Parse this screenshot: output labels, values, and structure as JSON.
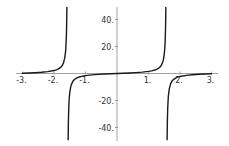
{
  "chart_data": {
    "type": "line",
    "title": "",
    "xlabel": "",
    "ylabel": "",
    "function": "tan(x)",
    "xlim": [
      -3.2,
      3.2
    ],
    "ylim": [
      -49,
      49
    ],
    "grid": false,
    "legend": null,
    "x_ticks": [
      -3,
      -2,
      -1,
      1,
      2,
      3
    ],
    "x_tick_labels": [
      "-3.",
      "-2.",
      "-1.",
      "1.",
      "2.",
      "3."
    ],
    "y_ticks": [
      40,
      20,
      -20,
      -40
    ],
    "y_tick_labels": [
      "40.",
      "20.",
      "-20.",
      "-40."
    ],
    "colors": {
      "curve": "#1a1a1a",
      "axis": "#8a8a8a",
      "background": "#ffffff"
    },
    "series": [
      {
        "name": "tan(x) branch 1",
        "x": [
          -3.0,
          -2.8,
          -2.6,
          -2.4,
          -2.2,
          -2.0,
          -1.9,
          -1.8,
          -1.75,
          -1.7,
          -1.66,
          -1.63,
          -1.61,
          -1.6,
          -1.595,
          -1.5912
        ],
        "y": [
          0.1425,
          0.3555,
          0.6016,
          0.916,
          1.3738,
          2.185,
          2.9271,
          4.2863,
          5.5221,
          7.6966,
          11.3849,
          16.8341,
          25.495,
          34.2325,
          41.5,
          49.0
        ]
      },
      {
        "name": "tan(x) branch 2",
        "x": [
          -1.5504,
          -1.545,
          -1.54,
          -1.53,
          -1.52,
          -1.5,
          -1.47,
          -1.44,
          -1.4,
          -1.35,
          -1.3,
          -1.2,
          -1.1,
          -1.0,
          -0.8,
          -0.6,
          -0.4,
          -0.2,
          0.0,
          0.2,
          0.4,
          0.6,
          0.8,
          1.0,
          1.1,
          1.2,
          1.3,
          1.35,
          1.4,
          1.44,
          1.47,
          1.5,
          1.52,
          1.53,
          1.54,
          1.545,
          1.5504
        ],
        "y": [
          -49.0,
          -38.48,
          -32.46,
          -24.5,
          -19.67,
          -14.1,
          -9.887,
          -7.6966,
          -5.7979,
          -4.4552,
          -3.6021,
          -2.5722,
          -1.9648,
          -1.5574,
          -1.0296,
          -0.6841,
          -0.4228,
          -0.2027,
          0.0,
          0.2027,
          0.4228,
          0.6841,
          1.0296,
          1.5574,
          1.9648,
          2.5722,
          3.6021,
          4.4552,
          5.7979,
          7.6966,
          9.887,
          14.1,
          19.67,
          24.5,
          32.46,
          38.48,
          49.0
        ]
      },
      {
        "name": "tan(x) branch 3",
        "x": [
          1.5912,
          1.595,
          1.6,
          1.61,
          1.63,
          1.66,
          1.7,
          1.75,
          1.8,
          1.9,
          2.0,
          2.2,
          2.4,
          2.6,
          2.8,
          3.0
        ],
        "y": [
          -49.0,
          -41.5,
          -34.2325,
          -25.495,
          -16.8341,
          -11.3849,
          -7.6966,
          -5.5221,
          -4.2863,
          -2.9271,
          -2.185,
          -1.3738,
          -0.916,
          -0.6016,
          -0.3555,
          -0.1425
        ]
      }
    ]
  },
  "layout": {
    "origin_px": [
      117,
      73.5
    ],
    "x_px_per_unit": 31.5,
    "y_px_per_unit": 1.35,
    "x_axis_px": [
      16,
      218
    ],
    "y_axis_px": [
      7,
      141
    ]
  }
}
